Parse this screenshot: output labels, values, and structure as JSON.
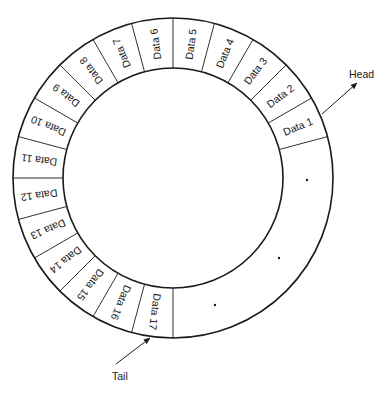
{
  "diagram": {
    "type": "circular-buffer",
    "center": [
      173,
      178
    ],
    "outer_radius": 160,
    "inner_radius": 110,
    "segment_degrees": 15,
    "start_angle_deg": 15,
    "colors": {
      "stroke": "#1a1a1a",
      "background": "#ffffff",
      "text": "#1a1a1a"
    },
    "segments": [
      "Data 1",
      "Data 2",
      "Data 3",
      "Data 4",
      "Data 5",
      "Data 6",
      "Data 7",
      "Data 8",
      "Data 9",
      "Data 10",
      "Data 11",
      "Data 12",
      "Data 13",
      "Data 14",
      "Data 15",
      "Data 16",
      "Data 17"
    ],
    "empty_region_dots": [
      [
        307,
        180
      ],
      [
        279,
        258
      ],
      [
        215,
        305
      ]
    ],
    "head": {
      "label": "Head",
      "arrow_from": [
        322,
        114
      ],
      "arrow_to": [
        357,
        83
      ],
      "label_pos": [
        349,
        78
      ]
    },
    "tail": {
      "label": "Tail",
      "arrow_from": [
        116,
        364
      ],
      "arrow_to": [
        150,
        338
      ],
      "label_pos": [
        112,
        380
      ]
    }
  }
}
